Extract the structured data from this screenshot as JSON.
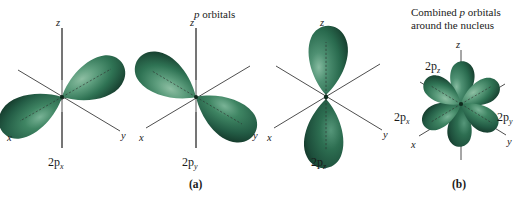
{
  "figure": {
    "title": "p orbitals",
    "title_italic_prefix": "p",
    "title_rest": " orbitals",
    "panel_a_letter": "(a)",
    "panel_b_letter": "(b)",
    "panel_b_caption_line1_pre": "Combined ",
    "panel_b_caption_line1_ital": "p",
    "panel_b_caption_line1_post": " orbitals",
    "panel_b_caption_line2": "around the nucleus",
    "colors": {
      "lobe_dark": "#215943",
      "lobe_mid": "#2f7354",
      "lobe_light": "#5e9e7e",
      "lobe_highlight": "#8ebfa3",
      "lobe_shadow": "#173f2f",
      "axis": "#3a3a3a",
      "text": "#1a1a1a",
      "background": "#ffffff"
    }
  },
  "orbitals": [
    {
      "id": "2px",
      "label_main": "2p",
      "label_sub": "x",
      "lobe_axis": "x",
      "description": "two lobes along the x axis"
    },
    {
      "id": "2py",
      "label_main": "2p",
      "label_sub": "y",
      "lobe_axis": "y",
      "description": "two lobes along the y axis"
    },
    {
      "id": "2pz",
      "label_main": "2p",
      "label_sub": "z",
      "lobe_axis": "z",
      "description": "two lobes along the z axis"
    }
  ],
  "axes": {
    "x_label": "x",
    "y_label": "y",
    "z_label": "z"
  },
  "combined": {
    "labels": [
      {
        "id": "2pz",
        "main": "2p",
        "sub": "z"
      },
      {
        "id": "2px",
        "main": "2p",
        "sub": "x"
      },
      {
        "id": "2py",
        "main": "2p",
        "sub": "y"
      }
    ],
    "axis_labels": {
      "x": "x",
      "y": "y",
      "z": "z"
    }
  }
}
